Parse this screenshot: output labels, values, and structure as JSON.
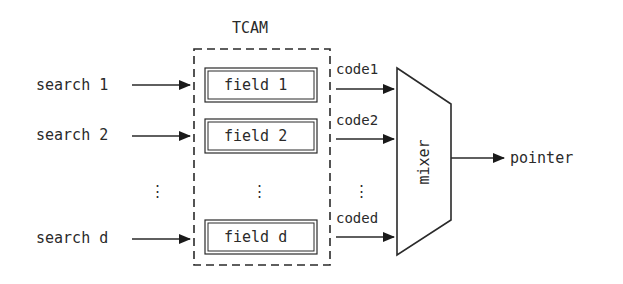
{
  "diagram": {
    "tcam_title": "TCAM",
    "inputs": [
      {
        "label": "search 1"
      },
      {
        "label": "search 2"
      },
      {
        "label": "search d"
      }
    ],
    "fields": [
      {
        "label": "field 1"
      },
      {
        "label": "field 2"
      },
      {
        "label": "field d"
      }
    ],
    "codes": [
      {
        "label": "code1"
      },
      {
        "label": "code2"
      },
      {
        "label": "coded"
      }
    ],
    "mixer_label": "mixer",
    "output_label": "pointer",
    "ellipsis": "⋮",
    "colors": {
      "stroke": "#2a2a2a",
      "background": "#ffffff"
    }
  }
}
